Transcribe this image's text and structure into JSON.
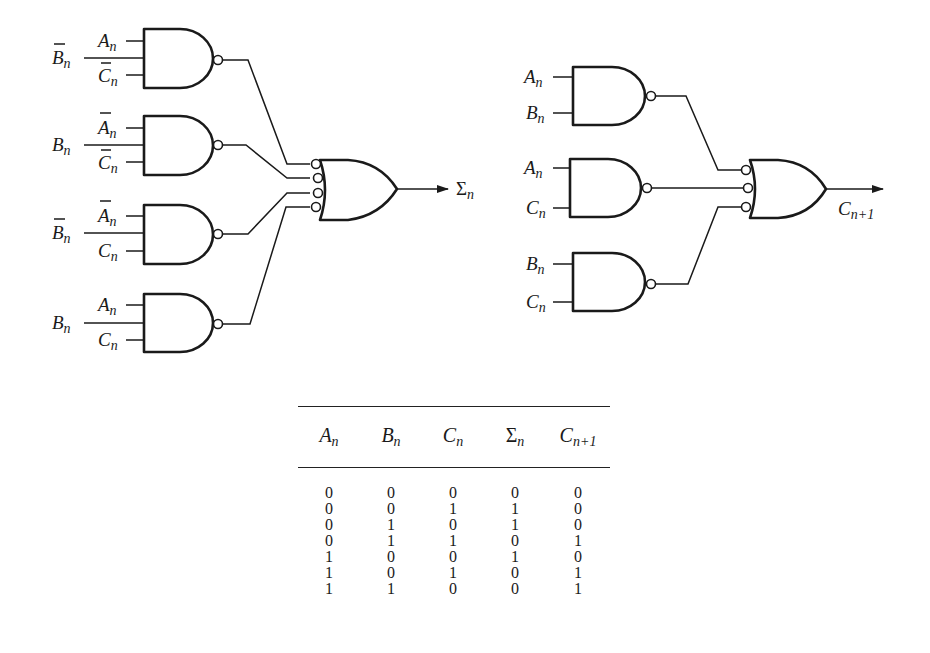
{
  "diagram": {
    "sum_circuit": {
      "output_label": "Σ",
      "output_sub": "n",
      "gates": [
        {
          "id": "nand1",
          "inputs": [
            {
              "var": "A",
              "sub": "n",
              "negated": false
            },
            {
              "var": "B",
              "sub": "n",
              "negated": true
            },
            {
              "var": "C",
              "sub": "n",
              "negated": true
            }
          ]
        },
        {
          "id": "nand2",
          "inputs": [
            {
              "var": "A",
              "sub": "n",
              "negated": true
            },
            {
              "var": "B",
              "sub": "n",
              "negated": false
            },
            {
              "var": "C",
              "sub": "n",
              "negated": true
            }
          ]
        },
        {
          "id": "nand3",
          "inputs": [
            {
              "var": "A",
              "sub": "n",
              "negated": true
            },
            {
              "var": "B",
              "sub": "n",
              "negated": true
            },
            {
              "var": "C",
              "sub": "n",
              "negated": false
            }
          ]
        },
        {
          "id": "nand4",
          "inputs": [
            {
              "var": "A",
              "sub": "n",
              "negated": false
            },
            {
              "var": "B",
              "sub": "n",
              "negated": false
            },
            {
              "var": "C",
              "sub": "n",
              "negated": false
            }
          ]
        }
      ],
      "combiner": "OR with inverted inputs (4 inputs)"
    },
    "carry_circuit": {
      "output_label": "C",
      "output_sub": "n+1",
      "gates": [
        {
          "id": "nand1",
          "inputs": [
            {
              "var": "A",
              "sub": "n"
            },
            {
              "var": "B",
              "sub": "n"
            }
          ]
        },
        {
          "id": "nand2",
          "inputs": [
            {
              "var": "A",
              "sub": "n"
            },
            {
              "var": "C",
              "sub": "n"
            }
          ]
        },
        {
          "id": "nand3",
          "inputs": [
            {
              "var": "B",
              "sub": "n"
            },
            {
              "var": "C",
              "sub": "n"
            }
          ]
        }
      ],
      "combiner": "OR with inverted inputs (3 inputs)"
    },
    "labels": {
      "A": "A",
      "B": "B",
      "C": "C",
      "n": "n",
      "sigma": "Σ",
      "np1": "n+1"
    }
  },
  "truth_table": {
    "headers": [
      {
        "main": "A",
        "sub": "n"
      },
      {
        "main": "B",
        "sub": "n"
      },
      {
        "main": "C",
        "sub": "n"
      },
      {
        "main": "Σ",
        "sub": "n"
      },
      {
        "main": "C",
        "sub": "n+1"
      }
    ],
    "rows": [
      [
        "0",
        "0",
        "0",
        "0",
        "0"
      ],
      [
        "0",
        "0",
        "1",
        "1",
        "0"
      ],
      [
        "0",
        "1",
        "0",
        "1",
        "0"
      ],
      [
        "0",
        "1",
        "1",
        "0",
        "1"
      ],
      [
        "1",
        "0",
        "0",
        "1",
        "0"
      ],
      [
        "1",
        "0",
        "1",
        "0",
        "1"
      ],
      [
        "1",
        "1",
        "0",
        "0",
        "1"
      ]
    ]
  }
}
